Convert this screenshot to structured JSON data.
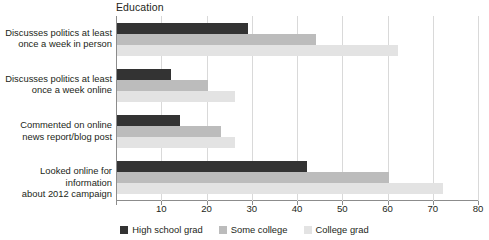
{
  "chart_data": {
    "type": "bar",
    "orientation": "horizontal",
    "title": "Education",
    "xlabel": "",
    "ylabel": "",
    "xlim": [
      0,
      80
    ],
    "xticks": [
      0,
      10,
      20,
      30,
      40,
      50,
      60,
      70,
      80
    ],
    "xtick_labels": [
      "",
      "10",
      "20",
      "30",
      "40",
      "50",
      "60",
      "70",
      "80"
    ],
    "grid": true,
    "legend_position": "bottom",
    "categories": [
      "Discusses politics at least once a week in person",
      "Discusses politics at least once a week online",
      "Commented on online news report/blog post",
      "Looked online for information about 2012 campaign"
    ],
    "category_lines": [
      [
        "Discusses politics at least",
        "once a week in person"
      ],
      [
        "Discusses politics at least",
        "once a week online"
      ],
      [
        "Commented on online",
        "news report/blog post"
      ],
      [
        "Looked online for information",
        "about 2012 campaign"
      ]
    ],
    "series": [
      {
        "name": "High school grad",
        "color": "#333333",
        "values": [
          29,
          12,
          14,
          42
        ]
      },
      {
        "name": "Some college",
        "color": "#bcbcbc",
        "values": [
          44,
          20,
          23,
          60
        ]
      },
      {
        "name": "College grad",
        "color": "#e3e3e3",
        "values": [
          62,
          26,
          26,
          72
        ]
      }
    ]
  }
}
